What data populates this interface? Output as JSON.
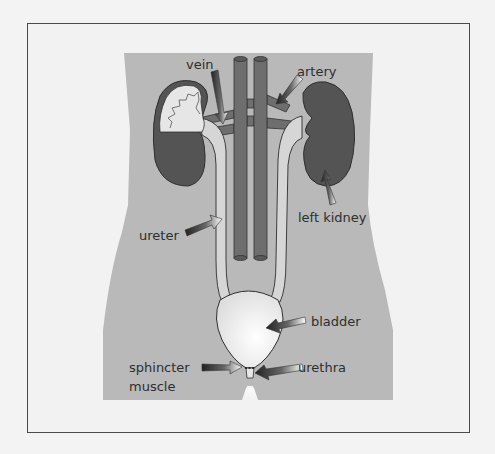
{
  "diagram": {
    "type": "anatomical-illustration",
    "colors": {
      "background": "#f2f2f2",
      "frame_border": "#4a4a4a",
      "body": "#b9b9b9",
      "kidney_dark": "#545454",
      "vessel": "#6e6e6e",
      "ureter_fill": "#d6d6d6",
      "bladder_fill": "#eaeaea",
      "outline": "#2e2e2e",
      "label_text": "#2e2e2e"
    },
    "labels": {
      "vein": "vein",
      "artery": "artery",
      "left_kidney": "left kidney",
      "ureter": "ureter",
      "bladder": "bladder",
      "sphincter_line1": "sphincter",
      "sphincter_line2": "muscle",
      "urethra": "urethra"
    }
  }
}
